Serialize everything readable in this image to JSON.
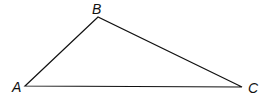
{
  "diagram": {
    "type": "triangle",
    "vertices": [
      {
        "label": "A",
        "x": 25,
        "y": 86,
        "label_x": 12,
        "label_y": 92
      },
      {
        "label": "B",
        "x": 98,
        "y": 17,
        "label_x": 92,
        "label_y": 14
      },
      {
        "label": "C",
        "x": 242,
        "y": 87,
        "label_x": 248,
        "label_y": 93
      }
    ],
    "stroke_color": "#111111"
  }
}
